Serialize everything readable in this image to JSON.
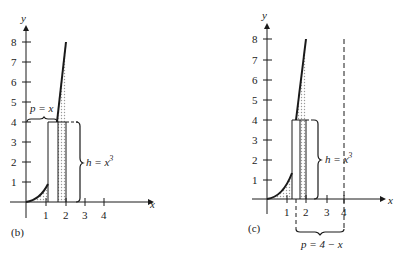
{
  "figures": [
    {
      "id": "b",
      "panel_label": "(b)",
      "axis_x_label": "x",
      "axis_y_label": "y",
      "x_ticks": [
        "1",
        "2",
        "3",
        "4"
      ],
      "y_ticks": [
        "1",
        "2",
        "3",
        "4",
        "5",
        "6",
        "7",
        "8"
      ],
      "label_p": "p = x",
      "label_h": "h = x",
      "label_h_exp": "3"
    },
    {
      "id": "c",
      "panel_label": "(c)",
      "axis_x_label": "x",
      "axis_y_label": "y",
      "x_ticks": [
        "1",
        "2",
        "3",
        "4"
      ],
      "y_ticks": [
        "1",
        "2",
        "3",
        "4",
        "5",
        "6",
        "7",
        "8"
      ],
      "label_p": "p = 4 − x",
      "label_h": "h = x",
      "label_h_exp": "3"
    }
  ],
  "colors": {
    "ink": "#1a1a1a",
    "shade": "#d9d9d9"
  }
}
